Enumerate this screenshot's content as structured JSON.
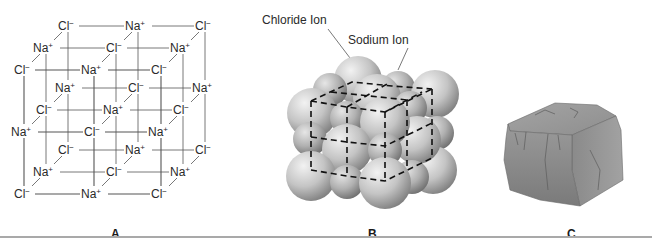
{
  "figure": {
    "panels": [
      {
        "id": "A",
        "label": "A.",
        "description": "3D ball-and-line lattice of NaCl showing alternating Na+ and Cl- ions in a 3x3x3 cubic arrangement",
        "ion_symbols": {
          "chloride": "Cl",
          "chloride_charge": "−",
          "sodium": "Na",
          "sodium_charge": "+"
        },
        "layers": [
          {
            "name": "back",
            "rows": [
              [
                "Cl−",
                "Na+",
                "Cl−"
              ],
              [
                "Na+",
                "Cl−",
                "Na+"
              ],
              [
                "Cl−",
                "Na+",
                "Cl−"
              ]
            ]
          },
          {
            "name": "middle",
            "rows": [
              [
                "Na+",
                "Cl−",
                "Na+"
              ],
              [
                "Cl−",
                "Na+",
                "Cl−"
              ],
              [
                "Na+",
                "Cl−",
                "Na+"
              ]
            ]
          },
          {
            "name": "front",
            "rows": [
              [
                "Cl−",
                "Na+",
                "Cl−"
              ],
              [
                "Na+",
                "Cl−",
                "Na+"
              ],
              [
                "Cl−",
                "Na+",
                "Cl−"
              ]
            ]
          }
        ]
      },
      {
        "id": "B",
        "label": "B.",
        "description": "Space-filling model of NaCl crystal: large chloride spheres and smaller sodium spheres with dashed unit-cell outline",
        "callouts": {
          "chloride": "Chloride Ion",
          "sodium": "Sodium Ion"
        }
      },
      {
        "id": "C",
        "label": "C.",
        "description": "Illustration of a cubic rock-salt (halite) crystal"
      }
    ]
  },
  "colors": {
    "line": "#555555",
    "text": "#2a2a2a",
    "sphere_light": "#e8e8e8",
    "sphere_dark": "#8c8c8c",
    "rock": "#8a8a8a",
    "divider": "#a9a9a9"
  }
}
